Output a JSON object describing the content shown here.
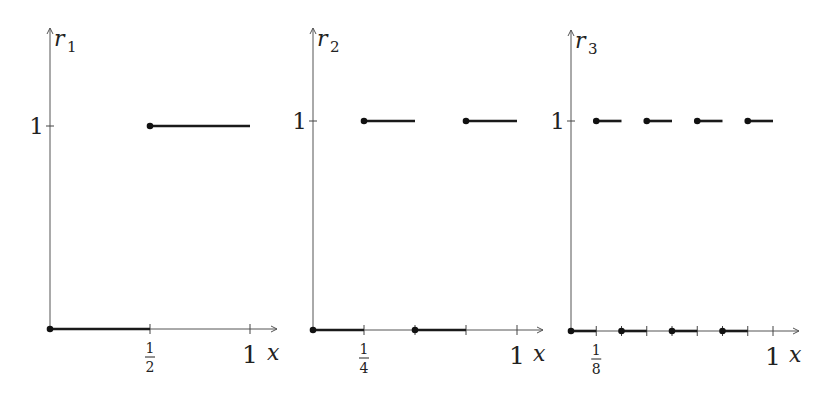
{
  "chart_data": [
    {
      "type": "line",
      "subtype": "step",
      "ylabel": "r",
      "ylabel_sub": "1",
      "xlabel": "x",
      "xlim": [
        0,
        1
      ],
      "ylim": [
        0,
        1
      ],
      "x_ticks": [
        0.5,
        1
      ],
      "x_tick_labels": [
        {
          "num": "1",
          "den": "2"
        },
        {
          "text": "1"
        }
      ],
      "y_ticks": [
        1
      ],
      "y_tick_labels": [
        "1"
      ],
      "grid": false,
      "segments": [
        {
          "x0": 0,
          "x1": 0.5,
          "y": 0,
          "closed_left": true
        },
        {
          "x0": 0.5,
          "x1": 1,
          "y": 1,
          "closed_left": true
        }
      ]
    },
    {
      "type": "line",
      "subtype": "step",
      "ylabel": "r",
      "ylabel_sub": "2",
      "xlabel": "x",
      "xlim": [
        0,
        1
      ],
      "ylim": [
        0,
        1
      ],
      "x_ticks": [
        0.25,
        0.5,
        0.75,
        1
      ],
      "x_tick_labels": [
        {
          "num": "1",
          "den": "4"
        },
        {
          "text": ""
        },
        {
          "text": ""
        },
        {
          "text": "1"
        }
      ],
      "y_ticks": [
        1
      ],
      "y_tick_labels": [
        "1"
      ],
      "grid": false,
      "segments": [
        {
          "x0": 0,
          "x1": 0.25,
          "y": 0,
          "closed_left": true
        },
        {
          "x0": 0.25,
          "x1": 0.5,
          "y": 1,
          "closed_left": true
        },
        {
          "x0": 0.5,
          "x1": 0.75,
          "y": 0,
          "closed_left": true
        },
        {
          "x0": 0.75,
          "x1": 1,
          "y": 1,
          "closed_left": true
        }
      ]
    },
    {
      "type": "line",
      "subtype": "step",
      "ylabel": "r",
      "ylabel_sub": "3",
      "xlabel": "x",
      "xlim": [
        0,
        1
      ],
      "ylim": [
        0,
        1
      ],
      "x_ticks": [
        0.125,
        0.25,
        0.375,
        0.5,
        0.625,
        0.75,
        0.875,
        1
      ],
      "x_tick_labels": [
        {
          "num": "1",
          "den": "8"
        },
        {
          "text": ""
        },
        {
          "text": ""
        },
        {
          "text": ""
        },
        {
          "text": ""
        },
        {
          "text": ""
        },
        {
          "text": ""
        },
        {
          "text": "1"
        }
      ],
      "y_ticks": [
        1
      ],
      "y_tick_labels": [
        "1"
      ],
      "grid": false,
      "segments": [
        {
          "x0": 0,
          "x1": 0.125,
          "y": 0,
          "closed_left": true
        },
        {
          "x0": 0.125,
          "x1": 0.25,
          "y": 1,
          "closed_left": true
        },
        {
          "x0": 0.25,
          "x1": 0.375,
          "y": 0,
          "closed_left": true
        },
        {
          "x0": 0.375,
          "x1": 0.5,
          "y": 1,
          "closed_left": true
        },
        {
          "x0": 0.5,
          "x1": 0.625,
          "y": 0,
          "closed_left": true
        },
        {
          "x0": 0.625,
          "x1": 0.75,
          "y": 1,
          "closed_left": true
        },
        {
          "x0": 0.75,
          "x1": 0.875,
          "y": 0,
          "closed_left": true
        },
        {
          "x0": 0.875,
          "x1": 1,
          "y": 1,
          "closed_left": true
        }
      ]
    }
  ],
  "layout": [
    {
      "ox": 50,
      "oy": 329,
      "xscale": 200,
      "y1": 126,
      "ytop": 28,
      "xarrow": 277
    },
    {
      "ox": 313,
      "oy": 330,
      "xscale": 204,
      "y1": 121,
      "ytop": 28,
      "xarrow": 543
    },
    {
      "ox": 571,
      "oy": 331,
      "xscale": 202,
      "y1": 121,
      "ytop": 30,
      "xarrow": 799
    }
  ]
}
